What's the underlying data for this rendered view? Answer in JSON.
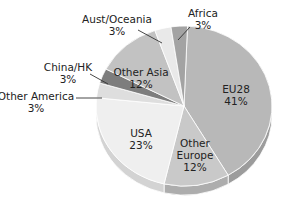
{
  "chart_data": {
    "type": "pie",
    "title": "",
    "style": "3d",
    "start": "top",
    "direction": "clockwise",
    "slices": [
      {
        "name": "EU28",
        "value": 41,
        "label": "41%",
        "color": "#b8b8b8",
        "side": "#9c9c9c",
        "label_pos": "inside"
      },
      {
        "name": "Other Europe",
        "value": 12,
        "label": "12%",
        "color": "#c9c9c9",
        "side": "#adadad",
        "label_pos": "inside",
        "lines": [
          "Other",
          "Europe"
        ]
      },
      {
        "name": "USA",
        "value": 23,
        "label": "23%",
        "color": "#efefef",
        "side": "#d3d3d3",
        "label_pos": "inside"
      },
      {
        "name": "Other America",
        "value": 3,
        "label": "3%",
        "color": "#dedede",
        "side": "#c4c4c4",
        "label_pos": "outside-left"
      },
      {
        "name": "China/HK",
        "value": 3,
        "label": "3%",
        "color": "#7d7d7d",
        "side": "#666666",
        "label_pos": "outside-left"
      },
      {
        "name": "Other Asia",
        "value": 12,
        "label": "12%",
        "color": "#c2c2c2",
        "side": "#a8a8a8",
        "label_pos": "inside",
        "lines": [
          "Other Asia"
        ]
      },
      {
        "name": "Aust/Oceania",
        "value": 3,
        "label": "3%",
        "color": "#e9e9e9",
        "side": "#cfcfcf",
        "label_pos": "outside-top"
      },
      {
        "name": "Africa",
        "value": 3,
        "label": "3%",
        "color": "#a3a3a3",
        "side": "#8c8c8c",
        "label_pos": "outside-top"
      }
    ]
  }
}
